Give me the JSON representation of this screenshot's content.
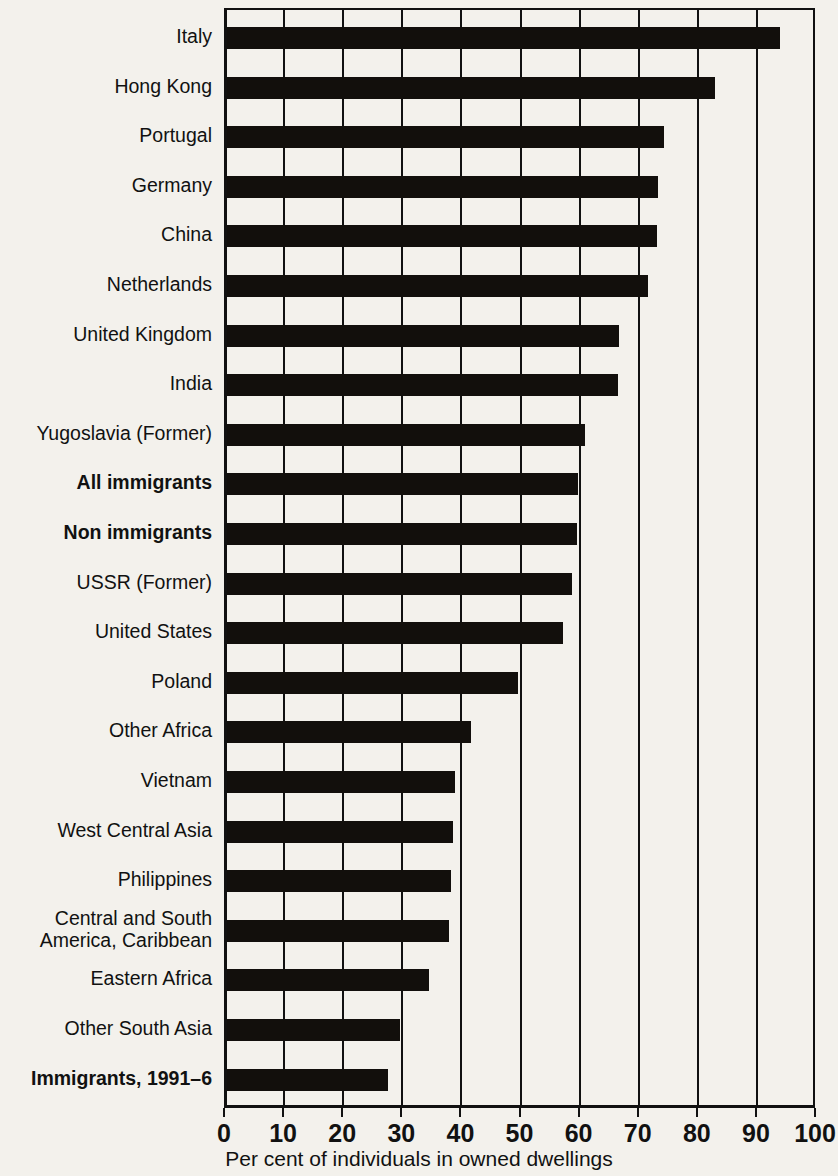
{
  "chart_data": {
    "type": "bar",
    "orientation": "horizontal",
    "title": "",
    "xlabel": "Per cent of individuals in owned dwellings",
    "ylabel": "",
    "xlim": [
      0,
      100
    ],
    "xticks": [
      0,
      10,
      20,
      30,
      40,
      50,
      60,
      70,
      80,
      90,
      100
    ],
    "xtick_labels": [
      "0",
      "10",
      "20",
      "30",
      "40",
      "50",
      "60",
      "70",
      "80",
      "90",
      "100"
    ],
    "grid": "vertical",
    "legend": "none",
    "bar_color": "#120f0c",
    "background_color": "#f3f1ec",
    "categories": [
      "Italy",
      "Hong Kong",
      "Portugal",
      "Germany",
      "China",
      "Netherlands",
      "United Kingdom",
      "India",
      "Yugoslavia (Former)",
      "All immigrants",
      "Non immigrants",
      "USSR (Former)",
      "United States",
      "Poland",
      "Other Africa",
      "Vietnam",
      "West Central Asia",
      "Philippines",
      "Central and South America, Caribbean",
      "Eastern Africa",
      "Other South Asia",
      "Immigrants, 1991–6"
    ],
    "values": [
      93.5,
      82.5,
      73.9,
      73.0,
      72.7,
      71.2,
      66.4,
      66.1,
      60.5,
      59.4,
      59.2,
      58.3,
      56.9,
      49.2,
      41.3,
      38.6,
      38.3,
      37.9,
      37.6,
      34.2,
      29.2,
      27.3
    ],
    "emphasized_categories": [
      "All immigrants",
      "Non immigrants",
      "Immigrants, 1991–6"
    ]
  },
  "categories_display": [
    {
      "lines": [
        "Italy"
      ],
      "bold": false
    },
    {
      "lines": [
        "Hong Kong"
      ],
      "bold": false
    },
    {
      "lines": [
        "Portugal"
      ],
      "bold": false
    },
    {
      "lines": [
        "Germany"
      ],
      "bold": false
    },
    {
      "lines": [
        "China"
      ],
      "bold": false
    },
    {
      "lines": [
        "Netherlands"
      ],
      "bold": false
    },
    {
      "lines": [
        "United Kingdom"
      ],
      "bold": false
    },
    {
      "lines": [
        "India"
      ],
      "bold": false
    },
    {
      "lines": [
        "Yugoslavia (Former)"
      ],
      "bold": false
    },
    {
      "lines": [
        "All immigrants"
      ],
      "bold": true
    },
    {
      "lines": [
        "Non immigrants"
      ],
      "bold": true
    },
    {
      "lines": [
        "USSR (Former)"
      ],
      "bold": false
    },
    {
      "lines": [
        "United States"
      ],
      "bold": false
    },
    {
      "lines": [
        "Poland"
      ],
      "bold": false
    },
    {
      "lines": [
        "Other Africa"
      ],
      "bold": false
    },
    {
      "lines": [
        "Vietnam"
      ],
      "bold": false
    },
    {
      "lines": [
        "West Central Asia"
      ],
      "bold": false
    },
    {
      "lines": [
        "Philippines"
      ],
      "bold": false
    },
    {
      "lines": [
        "Central and South",
        "America, Caribbean"
      ],
      "bold": false
    },
    {
      "lines": [
        "Eastern Africa"
      ],
      "bold": false
    },
    {
      "lines": [
        "Other South Asia"
      ],
      "bold": false
    },
    {
      "lines": [
        "Immigrants, 1991–6"
      ],
      "bold": true
    }
  ]
}
